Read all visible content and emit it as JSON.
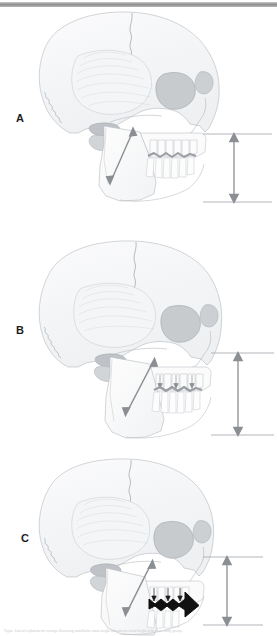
{
  "figure": {
    "background_color": "#ffffff",
    "top_rule_color": "#8e8e8e",
    "outline_color": "#b9bdc2",
    "shading_color": "#d9dce0",
    "orbit_fill": "#c6c9cc",
    "arrow_color": "#8b8f94",
    "reference_line_color": "#a9adb2",
    "black_arrow_color": "#111111",
    "occlusal_band_color": "#9a9ea3"
  },
  "panels": [
    {
      "id": "A",
      "label": "A",
      "label_x": 16,
      "label_y": 120,
      "description": "Lateral skull with short mandibular ramus arrow and normal anterior facial height",
      "ramus_arrow": {
        "name": "mandibular-ramus-arrow",
        "double_headed": true,
        "x1": 132,
        "y1": 130,
        "x2": 110,
        "y2": 182
      },
      "facial_height_arrow": {
        "name": "anterior-facial-height-arrow",
        "double_headed": true,
        "x": 234,
        "y_top": 137,
        "y_bottom": 199,
        "length_px": 62
      },
      "reference_lines": [
        {
          "name": "upper-reference-line",
          "x1": 203,
          "x2": 270,
          "y": 134
        },
        {
          "name": "lower-reference-line",
          "x1": 203,
          "x2": 270,
          "y": 202
        }
      ],
      "occlusal_marker": {
        "type": "gray-band",
        "arrow_direction": "none"
      }
    },
    {
      "id": "B",
      "label": "B",
      "label_x": 16,
      "label_y": 331,
      "description": "Lateral skull with longer mandibular ramus arrow and increased anterior facial height",
      "ramus_arrow": {
        "name": "mandibular-ramus-arrow",
        "double_headed": true,
        "x1": 152,
        "y1": 360,
        "x2": 126,
        "y2": 408
      },
      "facial_height_arrow": {
        "name": "anterior-facial-height-arrow",
        "double_headed": true,
        "x": 238,
        "y_top": 356,
        "y_bottom": 432,
        "length_px": 76
      },
      "reference_lines": [
        {
          "name": "upper-reference-line",
          "x1": 211,
          "x2": 272,
          "y": 353
        },
        {
          "name": "lower-reference-line",
          "x1": 211,
          "x2": 272,
          "y": 435
        }
      ],
      "occlusal_marker": {
        "type": "gray-band",
        "arrow_direction": "none"
      }
    },
    {
      "id": "C",
      "label": "C",
      "label_x": 21,
      "label_y": 538,
      "description": "Lateral skull with ramus arrow, bold black anterior occlusal arrow and largest anterior facial height",
      "ramus_arrow": {
        "name": "mandibular-ramus-arrow",
        "double_headed": true,
        "x1": 150,
        "y1": 560,
        "x2": 127,
        "y2": 610
      },
      "facial_height_arrow": {
        "name": "anterior-facial-height-arrow",
        "double_headed": true,
        "x": 227,
        "y_top": 560,
        "y_bottom": 622,
        "length_px": 62
      },
      "reference_lines": [
        {
          "name": "upper-reference-line",
          "x1": 203,
          "x2": 262,
          "y": 557
        },
        {
          "name": "lower-reference-line",
          "x1": 203,
          "x2": 262,
          "y": 625
        }
      ],
      "occlusal_marker": {
        "type": "black-arrow",
        "arrow_direction": "anterior-right"
      }
    }
  ],
  "caption": {
    "text": "Figure. Lateral cephalometric tracings illustrating mandibular ramus height and anterior facial height in the three study groups."
  }
}
